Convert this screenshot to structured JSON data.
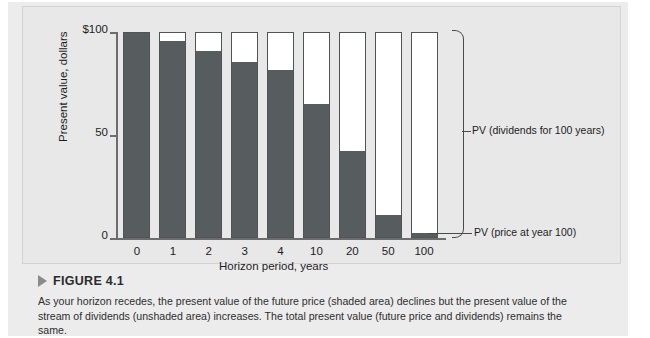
{
  "chart_data": {
    "type": "bar",
    "title": "",
    "subtitle": "",
    "xlabel": "Horizon period, years",
    "ylabel": "Present value, dollars",
    "categories": [
      "0",
      "1",
      "2",
      "3",
      "4",
      "10",
      "20",
      "50",
      "100"
    ],
    "ylim": [
      0,
      100
    ],
    "y_ticks": [
      {
        "value": 100,
        "label": "$100"
      },
      {
        "value": 50,
        "label": "50"
      },
      {
        "value": 0,
        "label": "0"
      }
    ],
    "grid": false,
    "legend_position": "right-annotations",
    "stacked": true,
    "series": [
      {
        "name": "PV (price at year 100)",
        "shading": "shaded",
        "color": "#575c5e",
        "values": [
          100,
          96,
          91,
          86,
          82,
          65,
          42,
          11,
          2
        ]
      },
      {
        "name": "PV (dividends for 100 years)",
        "shading": "unshaded",
        "color": "#ffffff",
        "values": [
          0,
          4,
          9,
          14,
          18,
          35,
          58,
          89,
          98
        ]
      }
    ],
    "totals": [
      100,
      100,
      100,
      100,
      100,
      100,
      100,
      100,
      100
    ],
    "annotations": [
      {
        "id": "dividends",
        "text": "PV (dividends for 100 years)"
      },
      {
        "id": "price",
        "text": "PV (price at year 100)"
      }
    ]
  },
  "figure": {
    "marker": "triangle-right-icon",
    "label": "FIGURE 4.1",
    "caption": "As your horizon recedes, the present value of the future price (shaded area) declines but the present value of the stream of dividends (unshaded area) increases. The total present value (future price and dividends) remains the same."
  },
  "colors": {
    "shaded_bar": "#575c5e",
    "unshaded_bar": "#ffffff",
    "bar_outline": "#4f5456",
    "panel_background": "#e8e8e8",
    "page_background": "#ececec",
    "axis": "#6d6d6d",
    "text": "#1d1d1d"
  }
}
